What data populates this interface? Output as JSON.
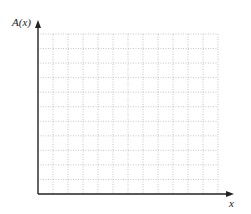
{
  "chart_data": {
    "type": "line",
    "title": "",
    "xlabel": "x",
    "ylabel": "A(x)",
    "series": [],
    "grid": true,
    "grid_style": "dotted",
    "grid_columns": 12,
    "grid_rows": 11,
    "x_ticks": [],
    "y_ticks": [],
    "legend": null,
    "note": "Blank graph grid with axes; no data plotted"
  },
  "colors": {
    "axis": "#222222",
    "grid": "#b8b8b8",
    "background": "#ffffff"
  }
}
